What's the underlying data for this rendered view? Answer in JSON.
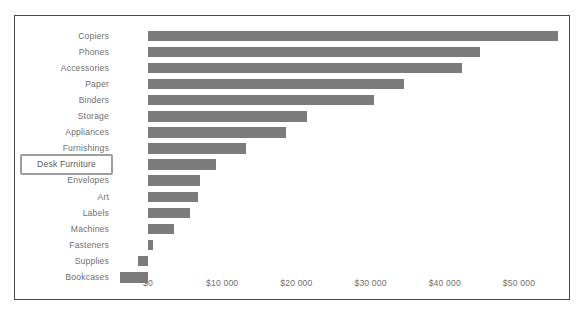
{
  "chart_data": {
    "type": "bar",
    "orientation": "horizontal",
    "title": "",
    "xlabel": "Profit",
    "ylabel": "",
    "xlim": [
      -5000,
      57500
    ],
    "grid": false,
    "legend": null,
    "bar_color": "#7b7b7b",
    "axis_text_color": "#6f6f6f",
    "frame_color": "#4a4a4a",
    "highlight_color": "#9e9e9e",
    "xticks": [
      {
        "value": 0,
        "label": "$0"
      },
      {
        "value": 10000,
        "label": "$10 000"
      },
      {
        "value": 20000,
        "label": "$20 000"
      },
      {
        "value": 30000,
        "label": "$30 000"
      },
      {
        "value": 40000,
        "label": "$40 000"
      },
      {
        "value": 50000,
        "label": "$50 000"
      }
    ],
    "categories": [
      "Copiers",
      "Phones",
      "Accessories",
      "Paper",
      "Binders",
      "Storage",
      "Appliances",
      "Furnishings",
      "Desk Furniture",
      "Envelopes",
      "Art",
      "Labels",
      "Machines",
      "Fasteners",
      "Supplies",
      "Bookcases"
    ],
    "values": [
      55200,
      44700,
      42300,
      34500,
      30400,
      21400,
      18600,
      13200,
      9200,
      7000,
      6700,
      5700,
      3500,
      700,
      -1300,
      -3800
    ],
    "highlighted_category": "Desk Furniture"
  }
}
